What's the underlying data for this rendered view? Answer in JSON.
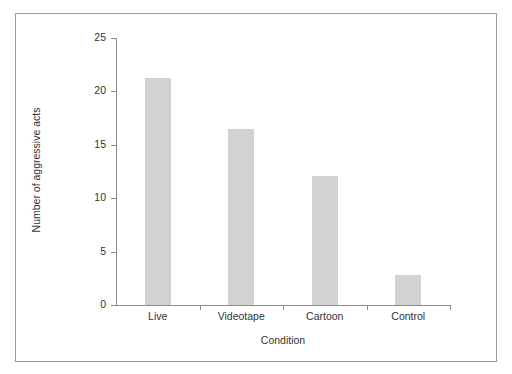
{
  "figure": {
    "background_color": "#ffffff",
    "frame_color": "#9a9a9a",
    "axis_color": "#8c8c8c",
    "bar_color": "#d2d2d2",
    "text_color": "#333333"
  },
  "chart_data": {
    "type": "bar",
    "title": "",
    "xlabel": "Condition",
    "ylabel": "Number of aggressive acts",
    "categories": [
      "Live",
      "Videotape",
      "Cartoon",
      "Control"
    ],
    "values": [
      21.3,
      16.5,
      12.1,
      2.8
    ],
    "ylim": [
      0,
      25
    ],
    "yticks": [
      0,
      5,
      10,
      15,
      20,
      25
    ],
    "ytick_labels": [
      "0",
      "5",
      "10",
      "15",
      "20",
      "25"
    ],
    "grid": false,
    "legend": null,
    "bar_color": "#d2d2d2"
  }
}
